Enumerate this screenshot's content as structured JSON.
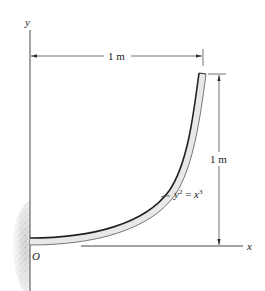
{
  "diagram": {
    "axes": {
      "y_label": "y",
      "x_label": "x",
      "origin_label": "O"
    },
    "dimensions": {
      "horizontal": "1 m",
      "vertical": "1 m"
    },
    "curve": {
      "equation_lhs": "y",
      "equation_lhs_exp": "2",
      "equation_mid": " = ",
      "equation_rhs": "x",
      "equation_rhs_exp": "3"
    },
    "colors": {
      "line": "#333333",
      "tube_fill": "#e8e8e8",
      "wall": "#c8c8c8"
    }
  }
}
